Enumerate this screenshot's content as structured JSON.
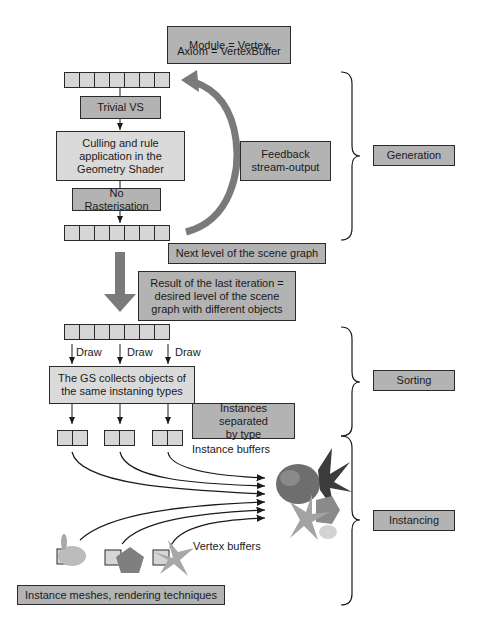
{
  "diagram": {
    "module_axiom": {
      "line1": "Module = Vertex",
      "line2": "Axiom = VertexBuffer"
    },
    "generation": {
      "trivial_vs": "Trivial VS",
      "culling": "Culling and rule\napplication in the\nGeometry Shader",
      "no_rasterisation": "No Rasterisation",
      "feedback": "Feedback\nstream-output",
      "next_level": "Next level of the scene graph",
      "buffer_cells": 7
    },
    "result_box": "Result of the last iteration =\ndesired level of the scene\ngraph with different objects",
    "sorting": {
      "draw_labels": [
        "Draw",
        "Draw",
        "Draw"
      ],
      "gs_collects": "The GS collects objects of\nthe same instaning types",
      "instances_separated": "Instances separated\nby type"
    },
    "instancing": {
      "instance_buffers": "Instance buffers",
      "vertex_buffers": "Vertex buffers",
      "instance_meshes": "Instance meshes, rendering techniques",
      "mesh_icons": [
        "bunny-mesh",
        "pentagon-mesh",
        "pinwheel-mesh"
      ]
    },
    "stages": [
      {
        "label": "Generation"
      },
      {
        "label": "Sorting"
      },
      {
        "label": "Instancing"
      }
    ],
    "colors": {
      "dark_box": "#b3b3b3",
      "light_box": "#dadada",
      "buffer_cell": "#d6d6d6",
      "big_arrow": "#777777",
      "border": "#2a2a2a"
    }
  }
}
